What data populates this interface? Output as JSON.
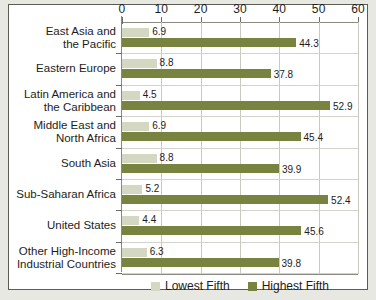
{
  "chart_data": {
    "type": "bar",
    "orientation": "horizontal",
    "title": "",
    "xlabel": "",
    "ylabel": "",
    "xlim": [
      0,
      60
    ],
    "xticks": [
      0,
      10,
      20,
      30,
      40,
      50,
      60
    ],
    "grid": true,
    "legend_position": "bottom",
    "categories": [
      "East Asia and\nthe Pacific",
      "Eastern Europe",
      "Latin America and\nthe Caribbean",
      "Middle East and\nNorth Africa",
      "South Asia",
      "Sub-Saharan Africa",
      "United States",
      "Other High-Income\nIndustrial Countries"
    ],
    "series": [
      {
        "name": "Lowest Fifth",
        "color": "#d4d8c3",
        "values": [
          6.9,
          8.8,
          4.5,
          6.9,
          8.8,
          5.2,
          4.4,
          6.3
        ]
      },
      {
        "name": "Highest Fifth",
        "color": "#77833f",
        "values": [
          44.3,
          37.8,
          52.9,
          45.4,
          39.9,
          52.4,
          45.6,
          39.8
        ]
      }
    ]
  },
  "categories": [
    {
      "line1": "East Asia and",
      "line2": "the Pacific"
    },
    {
      "line1": "Eastern Europe",
      "line2": ""
    },
    {
      "line1": "Latin America and",
      "line2": "the Caribbean"
    },
    {
      "line1": "Middle East and",
      "line2": "North Africa"
    },
    {
      "line1": "South Asia",
      "line2": ""
    },
    {
      "line1": "Sub-Saharan Africa",
      "line2": ""
    },
    {
      "line1": "United States",
      "line2": ""
    },
    {
      "line1": "Other High-Income",
      "line2": "Industrial Countries"
    }
  ],
  "axis": {
    "ticks": [
      {
        "label": "0"
      },
      {
        "label": "10"
      },
      {
        "label": "20"
      },
      {
        "label": "30"
      },
      {
        "label": "40"
      },
      {
        "label": "50"
      },
      {
        "label": "60"
      }
    ]
  },
  "values": {
    "low": [
      "6.9",
      "8.8",
      "4.5",
      "6.9",
      "8.8",
      "5.2",
      "4.4",
      "6.3"
    ],
    "high": [
      "44.3",
      "37.8",
      "52.9",
      "45.4",
      "39.9",
      "52.4",
      "45.6",
      "39.8"
    ]
  },
  "legend": {
    "items": [
      {
        "label": "Lowest Fifth",
        "color": "#d4d8c3"
      },
      {
        "label": "Highest Fifth",
        "color": "#77833f"
      }
    ]
  },
  "colors": {
    "lowest_fifth": "#d4d8c3",
    "highest_fifth": "#77833f",
    "frame_border": "#5d5d55",
    "page_background": "#e8e8e2",
    "plot_background": "#ffffff",
    "gridline": "#c9c9bf"
  }
}
